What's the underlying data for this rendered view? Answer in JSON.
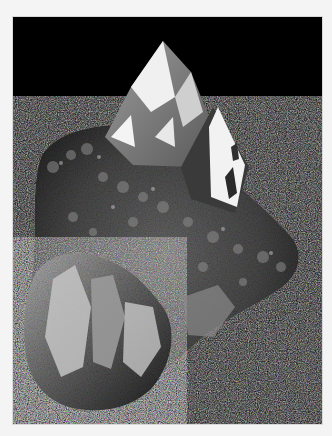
{
  "image": {
    "subject": "Quartz crystal cluster",
    "alt": "Grayscale photograph of a quartz crystal cluster with large pointed terminations on a black background",
    "style": "grayscale",
    "colors": {
      "page_border": "#f4f4f4",
      "background": "#000000",
      "crystal_highlight": "#f2f2f2",
      "crystal_mid": "#8a8a8a",
      "crystal_shadow": "#2e2e2e"
    }
  }
}
